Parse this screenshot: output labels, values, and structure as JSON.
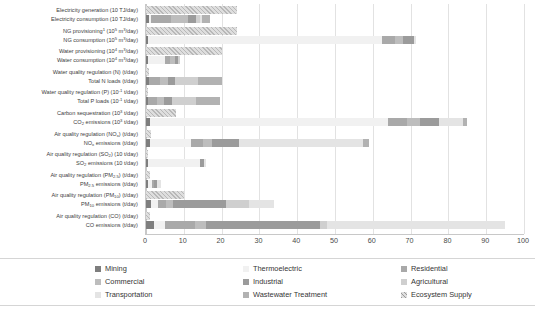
{
  "chart_data": {
    "type": "bar",
    "orientation": "horizontal",
    "stacked": true,
    "title": "",
    "xlabel": "",
    "ylabel": "",
    "xlim": [
      0,
      100
    ],
    "xticks": [
      0,
      10,
      20,
      30,
      40,
      50,
      60,
      70,
      80,
      90,
      100
    ],
    "grid": true,
    "legend_position": "bottom",
    "series": [
      {
        "name": "Mining",
        "color": "#7e7e7e"
      },
      {
        "name": "Thermoelectric",
        "color": "#f1f1f1"
      },
      {
        "name": "Residential",
        "color": "#a9a9a9"
      },
      {
        "name": "Commercial",
        "color": "#bdbdbd"
      },
      {
        "name": "Industrial",
        "color": "#9b9b9b"
      },
      {
        "name": "Agricultural",
        "color": "#cfcfcf"
      },
      {
        "name": "Transportation",
        "color": "#e4e4e4"
      },
      {
        "name": "Wastewater Treatment",
        "color": "#b2b2b2"
      },
      {
        "name": "Ecosystem Supply",
        "color": "#dedede"
      }
    ],
    "categories": [
      "Electricity generation (10 TJ/day)",
      "Electricity consumption (10 TJ/day)",
      "NG provisioning (10⁵ m³/day)",
      "NG consumption (10⁵ m³/day)",
      "Water provisioning (10⁴ m³/day)",
      "Water consumption (10⁴ m³/day)",
      "Water quality regulation (N) (t/day)",
      "Total N loads (t/day)",
      "Water quality regulation (P) (10⁻¹ t/day)",
      "Total P loads (10⁻¹ t/day)",
      "Carbon sequestration (10³ t/day)",
      "CO₂ emissions (10³ t/day)",
      "Air quality regulation (NOₓ) (t/day)",
      "NOₓ emissions (t/day)",
      "Air quality regulation (SO₂) (10 t/day)",
      "SO₂ emissions (10 t/day)",
      "Air quality regulation (PM₂.₅) (t/day)",
      "PM₂.₅ emissions (t/day)",
      "Air quality regulation (PM₁₀) (t/day)",
      "PM₁₀ emissions (t/day)",
      "Air quality regulation (CO) (t/day)",
      "CO emissions (t/day)"
    ],
    "rows": [
      {
        "label_html": "Electricity generation (10 TJ/day)",
        "group": "supply",
        "total": 24.0,
        "segments": [
          {
            "series": "Ecosystem Supply",
            "value": 24.0
          }
        ]
      },
      {
        "label_html": "Electricity consumption (10 TJ/day)",
        "group": "demand",
        "total": 17.0,
        "segments": [
          {
            "series": "Mining",
            "value": 0.7
          },
          {
            "series": "Thermoelectric",
            "value": 0.6
          },
          {
            "series": "Residential",
            "value": 5.2
          },
          {
            "series": "Commercial",
            "value": 4.5
          },
          {
            "series": "Industrial",
            "value": 2.2
          },
          {
            "series": "Agricultural",
            "value": 1.0
          },
          {
            "series": "Transportation",
            "value": 0.6
          },
          {
            "series": "Wastewater Treatment",
            "value": 2.2
          }
        ]
      },
      {
        "label_html": "NG provisioning<sup>1</sup> (10<sup>5</sup> m<sup>3</sup>/day)",
        "group": "supply",
        "total": 24.0,
        "segments": [
          {
            "series": "Ecosystem Supply",
            "value": 24.0
          }
        ]
      },
      {
        "label_html": "NG consumption (10<sup>5</sup> m<sup>3</sup>/day)",
        "group": "demand",
        "total": 71.5,
        "segments": [
          {
            "series": "Mining",
            "value": 0.5
          },
          {
            "series": "Thermoelectric",
            "value": 62.0
          },
          {
            "series": "Residential",
            "value": 3.5
          },
          {
            "series": "Commercial",
            "value": 2.0
          },
          {
            "series": "Industrial",
            "value": 3.0
          },
          {
            "series": "Transportation",
            "value": 0.5
          }
        ]
      },
      {
        "label_html": "Water provisioning (10<sup>4</sup> m<sup>3</sup>/day)",
        "group": "supply",
        "total": 20.0,
        "segments": [
          {
            "series": "Ecosystem Supply",
            "value": 20.0
          }
        ]
      },
      {
        "label_html": "Water consumption (10<sup>4</sup> m<sup>3</sup>/day)",
        "group": "demand",
        "total": 9.0,
        "segments": [
          {
            "series": "Mining",
            "value": 0.5
          },
          {
            "series": "Thermoelectric",
            "value": 4.6
          },
          {
            "series": "Residential",
            "value": 1.2
          },
          {
            "series": "Commercial",
            "value": 1.5
          },
          {
            "series": "Industrial",
            "value": 0.7
          },
          {
            "series": "Agricultural",
            "value": 0.5
          }
        ]
      },
      {
        "label_html": "Water quality regulation (N) (t/day)",
        "group": "supply",
        "total": 0.8,
        "segments": [
          {
            "series": "Ecosystem Supply",
            "value": 0.8
          }
        ]
      },
      {
        "label_html": "Total N loads (t/day)",
        "group": "demand",
        "total": 20.0,
        "segments": [
          {
            "series": "Mining",
            "value": 0.8
          },
          {
            "series": "Residential",
            "value": 3.0
          },
          {
            "series": "Commercial",
            "value": 2.0
          },
          {
            "series": "Industrial",
            "value": 2.0
          },
          {
            "series": "Agricultural",
            "value": 6.0
          },
          {
            "series": "Wastewater Treatment",
            "value": 6.2
          }
        ]
      },
      {
        "label_html": "Water quality regulation (P) (10<sup>-1</sup> t/day)",
        "group": "supply",
        "total": 0.5,
        "segments": [
          {
            "series": "Ecosystem Supply",
            "value": 0.5
          }
        ]
      },
      {
        "label_html": "Total P loads (10<sup>-1</sup> t/day)",
        "group": "demand",
        "total": 19.5,
        "segments": [
          {
            "series": "Mining",
            "value": 0.6
          },
          {
            "series": "Residential",
            "value": 2.4
          },
          {
            "series": "Commercial",
            "value": 1.8
          },
          {
            "series": "Industrial",
            "value": 2.0
          },
          {
            "series": "Agricultural",
            "value": 6.5
          },
          {
            "series": "Wastewater Treatment",
            "value": 6.2
          }
        ]
      },
      {
        "label_html": "Carbon sequestration (10<sup>3</sup> t/day)",
        "group": "supply",
        "total": 8.0,
        "segments": [
          {
            "series": "Ecosystem Supply",
            "value": 8.0
          }
        ]
      },
      {
        "label_html": "CO<sub>2</sub> emissions (10<sup>3</sup> t/day)",
        "group": "demand",
        "total": 85.0,
        "segments": [
          {
            "series": "Mining",
            "value": 1.0
          },
          {
            "series": "Thermoelectric",
            "value": 63.0
          },
          {
            "series": "Residential",
            "value": 5.0
          },
          {
            "series": "Commercial",
            "value": 3.5
          },
          {
            "series": "Industrial",
            "value": 5.0
          },
          {
            "series": "Transportation",
            "value": 6.5
          },
          {
            "series": "Wastewater Treatment",
            "value": 1.0
          }
        ]
      },
      {
        "label_html": "Air quality regulation (NO<sub>x</sub>) (t/day)",
        "group": "supply",
        "total": 1.2,
        "segments": [
          {
            "series": "Ecosystem Supply",
            "value": 1.2
          }
        ]
      },
      {
        "label_html": "NO<sub>x</sub> emissions (t/day)",
        "group": "demand",
        "total": 59.0,
        "segments": [
          {
            "series": "Mining",
            "value": 1.0
          },
          {
            "series": "Thermoelectric",
            "value": 11.0
          },
          {
            "series": "Residential",
            "value": 3.0
          },
          {
            "series": "Commercial",
            "value": 2.5
          },
          {
            "series": "Industrial",
            "value": 7.0
          },
          {
            "series": "Transportation",
            "value": 33.0
          },
          {
            "series": "Wastewater Treatment",
            "value": 1.5
          }
        ]
      },
      {
        "label_html": "Air quality regulation (SO<sub>2</sub>) (10 t/day)",
        "group": "supply",
        "total": 0.6,
        "segments": [
          {
            "series": "Ecosystem Supply",
            "value": 0.6
          }
        ]
      },
      {
        "label_html": "SO<sub>2</sub> emissions (10 t/day)",
        "group": "demand",
        "total": 16.0,
        "segments": [
          {
            "series": "Mining",
            "value": 0.4
          },
          {
            "series": "Thermoelectric",
            "value": 14.0
          },
          {
            "series": "Industrial",
            "value": 1.0
          },
          {
            "series": "Transportation",
            "value": 0.6
          }
        ]
      },
      {
        "label_html": "Air quality regulation (PM<sub>2.5</sub>) (t/day)",
        "group": "supply",
        "total": 1.1,
        "segments": [
          {
            "series": "Ecosystem Supply",
            "value": 1.1
          }
        ]
      },
      {
        "label_html": "PM<sub>2.5</sub> emissions (t/day)",
        "group": "demand",
        "total": 4.0,
        "segments": [
          {
            "series": "Mining",
            "value": 0.5
          },
          {
            "series": "Thermoelectric",
            "value": 1.0
          },
          {
            "series": "Residential",
            "value": 0.6
          },
          {
            "series": "Industrial",
            "value": 0.8
          },
          {
            "series": "Transportation",
            "value": 1.1
          }
        ]
      },
      {
        "label_html": "Air quality regulation (PM<sub>10</sub>) (t/day)",
        "group": "supply",
        "total": 10.0,
        "segments": [
          {
            "series": "Ecosystem Supply",
            "value": 10.0
          }
        ]
      },
      {
        "label_html": "PM<sub>10</sub> emissions (t/day)",
        "group": "demand",
        "total": 34.0,
        "segments": [
          {
            "series": "Mining",
            "value": 1.2
          },
          {
            "series": "Thermoelectric",
            "value": 2.0
          },
          {
            "series": "Residential",
            "value": 2.0
          },
          {
            "series": "Commercial",
            "value": 2.0
          },
          {
            "series": "Industrial",
            "value": 14.0
          },
          {
            "series": "Agricultural",
            "value": 6.0
          },
          {
            "series": "Transportation",
            "value": 6.8
          }
        ]
      },
      {
        "label_html": "Air quality regulation (CO) (t/day)",
        "group": "supply",
        "total": 1.0,
        "segments": [
          {
            "series": "Ecosystem Supply",
            "value": 1.0
          }
        ]
      },
      {
        "label_html": "CO emissions (t/day)",
        "group": "demand",
        "total": 95.0,
        "segments": [
          {
            "series": "Mining",
            "value": 2.0
          },
          {
            "series": "Thermoelectric",
            "value": 3.0
          },
          {
            "series": "Residential",
            "value": 8.0
          },
          {
            "series": "Commercial",
            "value": 3.0
          },
          {
            "series": "Industrial",
            "value": 30.0
          },
          {
            "series": "Agricultural",
            "value": 2.0
          },
          {
            "series": "Transportation",
            "value": 47.0
          }
        ]
      }
    ]
  },
  "legend": {
    "items": [
      {
        "label": "Mining",
        "color": "#7e7e7e",
        "pattern": "solid"
      },
      {
        "label": "Thermoelectric",
        "color": "#f1f1f1",
        "pattern": "solid"
      },
      {
        "label": "Residential",
        "color": "#a9a9a9",
        "pattern": "solid"
      },
      {
        "label": "Commercial",
        "color": "#bdbdbd",
        "pattern": "solid"
      },
      {
        "label": "Industrial",
        "color": "#9b9b9b",
        "pattern": "solid"
      },
      {
        "label": "Agricultural",
        "color": "#cfcfcf",
        "pattern": "solid"
      },
      {
        "label": "Transportation",
        "color": "#e4e4e4",
        "pattern": "solid"
      },
      {
        "label": "Wastewater Treatment",
        "color": "#b2b2b2",
        "pattern": "solid"
      },
      {
        "label": "Ecosystem Supply",
        "color": "#dedede",
        "pattern": "hatch"
      }
    ]
  }
}
